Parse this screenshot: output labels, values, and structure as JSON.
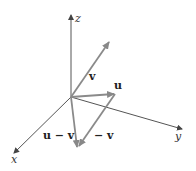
{
  "diagram": {
    "type": "3d-vector-diagram",
    "axes": [
      {
        "name": "x",
        "label": "x"
      },
      {
        "name": "y",
        "label": "y"
      },
      {
        "name": "z",
        "label": "z"
      }
    ],
    "vectors": [
      {
        "name": "v",
        "label": "v"
      },
      {
        "name": "u",
        "label": "u"
      },
      {
        "name": "u-minus-v",
        "label": "u − v"
      },
      {
        "name": "neg-v",
        "label": "− v"
      }
    ],
    "colors": {
      "axis": "#555555",
      "vector": "#8a8a8a",
      "text": "#222222"
    }
  }
}
